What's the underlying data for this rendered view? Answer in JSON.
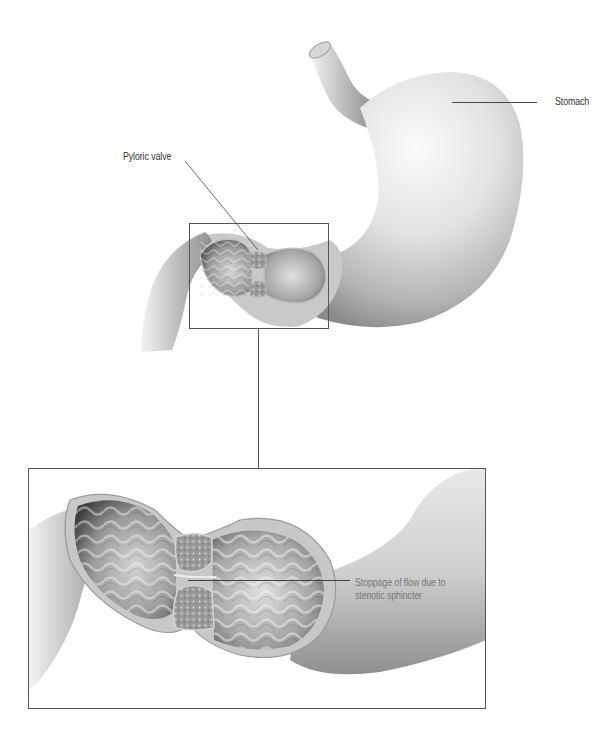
{
  "diagram": {
    "labels": {
      "stomach": "Stomach",
      "pyloric_valve": "Pyloric valve",
      "stoppage_line1": "Stoppage of flow due to",
      "stoppage_line2": "stenotic sphincter"
    },
    "panels": [
      {
        "name": "overview",
        "description": "Whole stomach with duodenum, pylorus region boxed"
      },
      {
        "name": "detail",
        "description": "Enlarged cutaway of pyloric region showing narrowed sphincter"
      }
    ],
    "colors": {
      "background": "#ffffff",
      "organ_light": "#e6e6e6",
      "organ_mid": "#b8b8b8",
      "organ_dark": "#6e6e6e",
      "box_stroke": "#555555",
      "leader_line": "#333333",
      "label_text": "#333333",
      "label_text_grey": "#777777"
    }
  }
}
